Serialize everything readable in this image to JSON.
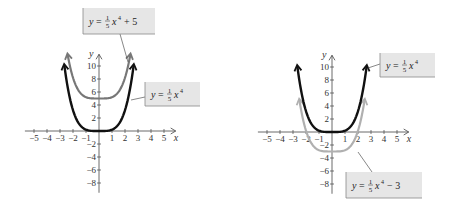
{
  "chart_data": [
    {
      "type": "line",
      "title": "",
      "xlabel": "x",
      "ylabel": "y",
      "xlim": [
        -5.5,
        6
      ],
      "ylim": [
        -9,
        11.5
      ],
      "x_ticks": [
        "-5",
        "-4",
        "-3",
        "-2",
        "-1",
        "1",
        "2",
        "3",
        "4",
        "5"
      ],
      "y_ticks": [
        "10",
        "8",
        "6",
        "4",
        "2",
        "-2",
        "-4",
        "-6",
        "-8"
      ],
      "grid": false,
      "series": [
        {
          "name": "y = 1/5 x^4",
          "color": "#111111",
          "function": "0.2*x^4",
          "x_range": [
            -2.66,
            2.66
          ]
        },
        {
          "name": "y = 1/5 x^4 + 5",
          "color": "#777777",
          "function": "0.2*x^4+5",
          "x_range": [
            -2.4,
            2.4
          ]
        }
      ],
      "annotations": [
        {
          "label_parts": {
            "lhs": "y",
            "eq": "=",
            "num": "1",
            "den": "5",
            "var": "x",
            "exp": "4",
            "tail": "+ 5"
          }
        },
        {
          "label_parts": {
            "lhs": "y",
            "eq": "=",
            "num": "1",
            "den": "5",
            "var": "x",
            "exp": "4",
            "tail": ""
          }
        }
      ]
    },
    {
      "type": "line",
      "title": "",
      "xlabel": "x",
      "ylabel": "y",
      "xlim": [
        -5.5,
        6
      ],
      "ylim": [
        -9,
        11.5
      ],
      "x_ticks": [
        "-5",
        "-4",
        "-3",
        "-2",
        "-1",
        "1",
        "2",
        "3",
        "4",
        "5"
      ],
      "y_ticks": [
        "10",
        "8",
        "6",
        "4",
        "2",
        "-2",
        "-4",
        "-6",
        "-8"
      ],
      "grid": false,
      "series": [
        {
          "name": "y = 1/5 x^4",
          "color": "#111111",
          "function": "0.2*x^4",
          "x_range": [
            -2.66,
            2.66
          ]
        },
        {
          "name": "y = 1/5 x^4 - 3",
          "color": "#b0b0b0",
          "function": "0.2*x^4-3",
          "x_range": [
            -2.5,
            2.5
          ]
        }
      ],
      "annotations": [
        {
          "label_parts": {
            "lhs": "y",
            "eq": "=",
            "num": "1",
            "den": "5",
            "var": "x",
            "exp": "4",
            "tail": ""
          }
        },
        {
          "label_parts": {
            "lhs": "y",
            "eq": "=",
            "num": "1",
            "den": "5",
            "var": "x",
            "exp": "4",
            "tail": "− 3"
          }
        }
      ]
    }
  ]
}
